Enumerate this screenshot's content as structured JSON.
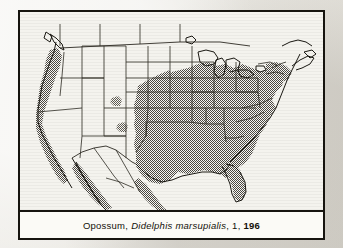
{
  "figure": {
    "caption": {
      "common_name": "Opossum",
      "scientific_name": "Didelphis marsupialis",
      "volume": "1",
      "page": "196",
      "separator": ","
    },
    "frame_color": "#16140f",
    "panel_background": "#fbfaf6",
    "page_background": "#eceae4"
  },
  "map": {
    "title": "Opossum distribution range map",
    "region": "North America (United States, southern Canada, Mexico)",
    "projection_note": "conic",
    "style": {
      "coastline_color": "#16140f",
      "boundary_color": "#2a2720",
      "range_fill": "#9a968e",
      "range_stipple": "halftone-checker",
      "land_fill": "#fbfaf6",
      "water_fill": "#fbfaf6"
    },
    "legend": {
      "shaded_meaning": "Known geographic range",
      "unshaded_meaning": "Outside range"
    },
    "range_description": [
      "Entire eastern United States from the Atlantic seaboard west to the Great Plains",
      "Northern limit along the Great Lakes and southern New England",
      "Florida peninsula fully included",
      "Gulf coast and all of Texas",
      "Disjunct introduced population along the Pacific coast of California, Oregon and Washington",
      "Eastern and western coastal Mexico extending south",
      "Absent from the Great Basin, northern Rocky Mountains and interior deserts"
    ]
  }
}
